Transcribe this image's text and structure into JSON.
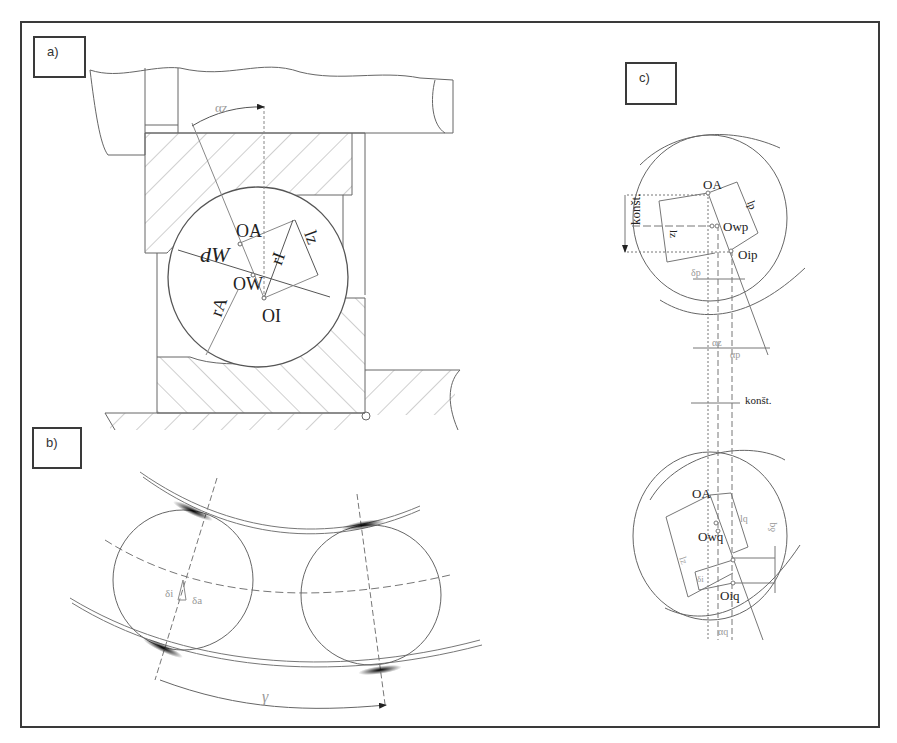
{
  "figure": {
    "panels": [
      {
        "id": "a",
        "label": "a)"
      },
      {
        "id": "b",
        "label": "b)"
      },
      {
        "id": "c",
        "label": "c)"
      }
    ]
  },
  "panel_a": {
    "angle_label": "αz",
    "center_A": "OA",
    "center_A_sub": "A",
    "center_W": "OW",
    "center_I": "OI",
    "diameter": "dW",
    "radius_inner": "rI",
    "radius_outer": "rA",
    "length": "lz"
  },
  "panel_b": {
    "delta_i": "δi",
    "delta_a": "δa",
    "gamma": "γ"
  },
  "panel_c": {
    "upper": {
      "center_A": "OA",
      "center_wp": "Owp",
      "center_ip": "Oip",
      "konst": "konšt.",
      "lp": "lp",
      "lz": "lz",
      "delta_p": "δp",
      "alpha_z": "αz",
      "alpha_p": "αp"
    },
    "middle_konst": "konšt.",
    "lower": {
      "center_A": "OA",
      "center_wq": "Owq",
      "center_iq": "Oiq",
      "lq": "lq",
      "lz": "lz",
      "delta_q": "δq",
      "delta_i": "δi",
      "alpha_q": "αq"
    }
  },
  "colors": {
    "line": "#555555",
    "frame": "#3a3a3a",
    "contact": "#111111"
  }
}
